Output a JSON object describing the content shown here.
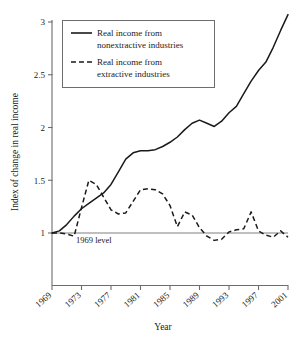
{
  "chart_data": {
    "type": "line",
    "title": "",
    "xlabel": "Year",
    "ylabel": "Index of change in real income",
    "xlim": [
      1969,
      2001
    ],
    "ylim": [
      0.51,
      3.05
    ],
    "grid": false,
    "legend_position": "top-left",
    "xticks": [
      "1969",
      "1973",
      "1977",
      "1981",
      "1985",
      "1989",
      "1993",
      "1997",
      "2001"
    ],
    "xtick_values": [
      1969,
      1973,
      1977,
      1981,
      1985,
      1989,
      1993,
      1997,
      2001
    ],
    "yticks": [
      "1",
      "1.5",
      "2",
      "2.5",
      "3"
    ],
    "ytick_values": [
      1,
      1.5,
      2,
      2.5,
      3
    ],
    "annotations": [
      {
        "text": "1969 level",
        "x": 1973.5,
        "y": 1.0,
        "kind": "reference-line-label"
      }
    ],
    "reference_line": {
      "y": 1.0,
      "label": "1969 level",
      "color": "#808080"
    },
    "x": [
      1969,
      1970,
      1971,
      1972,
      1973,
      1974,
      1975,
      1976,
      1977,
      1978,
      1979,
      1980,
      1981,
      1982,
      1983,
      1984,
      1985,
      1986,
      1987,
      1988,
      1989,
      1990,
      1991,
      1992,
      1993,
      1994,
      1995,
      1996,
      1997,
      1998,
      1999,
      2000,
      2001
    ],
    "series": [
      {
        "name": "Real income from nonextractive industries",
        "style": "solid",
        "color": "#1a1a1a",
        "values": [
          1.0,
          1.02,
          1.08,
          1.16,
          1.23,
          1.28,
          1.33,
          1.38,
          1.46,
          1.58,
          1.7,
          1.76,
          1.78,
          1.78,
          1.79,
          1.82,
          1.86,
          1.91,
          1.98,
          2.04,
          2.07,
          2.04,
          2.01,
          2.06,
          2.14,
          2.2,
          2.32,
          2.44,
          2.54,
          2.62,
          2.76,
          2.92,
          3.07
        ]
      },
      {
        "name": "Real income from extractive industries",
        "style": "dashed",
        "color": "#1a1a1a",
        "values": [
          1.0,
          1.0,
          0.99,
          0.97,
          1.24,
          1.5,
          1.46,
          1.34,
          1.22,
          1.18,
          1.19,
          1.3,
          1.41,
          1.42,
          1.41,
          1.37,
          1.26,
          1.06,
          1.2,
          1.17,
          1.05,
          0.97,
          0.93,
          0.94,
          1.01,
          1.03,
          1.04,
          1.2,
          1.02,
          0.98,
          0.96,
          1.02,
          0.96
        ]
      }
    ]
  },
  "legend": {
    "entries": [
      {
        "line1": "Real income from",
        "line2": "nonextractive industries",
        "style": "solid"
      },
      {
        "line1": "Real income from",
        "line2": "extractive industries",
        "style": "dashed"
      }
    ]
  },
  "axes": {
    "x_title": "Year",
    "y_title": "Index of change in real income"
  }
}
